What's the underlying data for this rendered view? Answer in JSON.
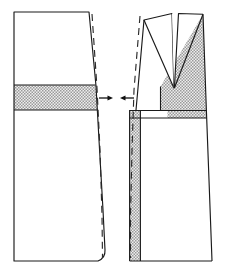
{
  "figure": {
    "background_color": "#ffffff",
    "line_color": "#1a1a1a",
    "hatch_color": "#8c8c8c",
    "hatch_background": "#e8e8e8",
    "dashed_line_color": "#2b2b2b",
    "stroke_width": 1.1
  },
  "pieces": [
    {
      "id": "left-pattern-piece",
      "name": "Left pattern piece",
      "label": "front block",
      "outline_points": "14,12 89,12 105,252 97,262 14,262",
      "hatch_band": {
        "name": "horizontal hatched band",
        "points": "14,85 96,85 98,110 14,110",
        "top_y": 85,
        "bottom_y": 110
      },
      "dashed_guide": "95,18 101,90 104,170 104,256"
    },
    {
      "id": "right-pattern-piece",
      "name": "Right pattern piece",
      "label": "back block with dart",
      "outline_points": "143,20 173,14 174,88 178,14 203,14 207,120 212,262 129,262 130,112 136,110",
      "dart": {
        "name": "dart-notch",
        "left_top": "143,20",
        "right_top": "178,14",
        "apex": "174,88",
        "opening_width": 35
      },
      "hatch_region": {
        "name": "L-shaped hatched insertion",
        "points": "129,262 129,110 160,110 160,86 203,14 205,100 207,112 205,118 167,118 167,110 140,110 140,262"
      },
      "dashed_guide": "138,22 134,90 131,170 131,256"
    }
  ],
  "annotations": {
    "arrows": {
      "name": "spread-measurement-arrows",
      "left_arrow": {
        "name": "left-pointing-arrow",
        "from_x": 100,
        "to_x": 112,
        "y": 98,
        "direction": "right"
      },
      "right_arrow": {
        "name": "right-pointing-arrow",
        "from_x": 133,
        "to_x": 121,
        "y": 98,
        "direction": "left"
      },
      "tick_left_x": 100,
      "tick_right_x": 133,
      "tick_top_y": 90,
      "tick_bottom_y": 106
    }
  }
}
